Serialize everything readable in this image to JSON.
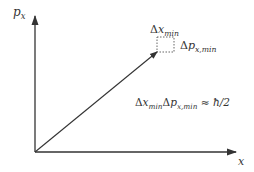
{
  "diagram": {
    "type": "phase-space",
    "axes": {
      "y_label": {
        "base": "p",
        "sub": "x"
      },
      "x_label": "x"
    },
    "cell_labels": {
      "dx": {
        "delta": "Δ",
        "base": "x",
        "sub": "min"
      },
      "dp": {
        "delta": "Δ",
        "base": "p",
        "sub": "x,min"
      }
    },
    "equation": {
      "d1": "Δ",
      "b1": "x",
      "s1": "min",
      "d2": "Δ",
      "b2": "p",
      "s2": "x,min",
      "rel": "≈",
      "rel_note": "relation symbol is ambiguous in source pixels (could be = or ≈); ≈ chosen but not confirmed",
      "rhs": "ħ/2"
    },
    "colors": {
      "stroke": "#333333",
      "background": "#ffffff"
    }
  }
}
